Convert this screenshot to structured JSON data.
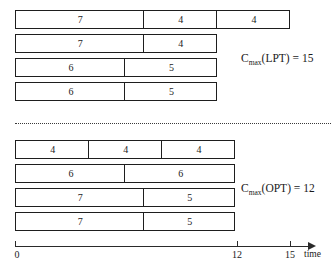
{
  "figure": {
    "axis": {
      "label": "time",
      "origin_value": 0,
      "ticks": [
        {
          "value": 0,
          "label": "0",
          "x": 15
        },
        {
          "value": 12,
          "label": "12",
          "x": 237
        },
        {
          "value": 15,
          "label": "15",
          "x": 290
        }
      ],
      "pixels_per_unit": 18.33,
      "x_start": 15
    },
    "schedules": [
      {
        "name": "LPT",
        "annotation": "C",
        "annotation_sub": "max",
        "annotation_rest": "(LPT) = 15",
        "makespan": 15,
        "annotation_x": 241,
        "annotation_y": 53,
        "machines": [
          {
            "machine": 1,
            "y": 10,
            "jobs": [
              7,
              4,
              4
            ]
          },
          {
            "machine": 2,
            "y": 34,
            "jobs": [
              7,
              4
            ]
          },
          {
            "machine": 3,
            "y": 58,
            "jobs": [
              6,
              5
            ]
          },
          {
            "machine": 4,
            "y": 82,
            "jobs": [
              6,
              5
            ]
          }
        ]
      },
      {
        "name": "OPT",
        "annotation": "C",
        "annotation_sub": "max",
        "annotation_rest": "(OPT) = 12",
        "makespan": 12,
        "annotation_x": 241,
        "annotation_y": 183,
        "machines": [
          {
            "machine": 1,
            "y": 140,
            "jobs": [
              4,
              4,
              4
            ]
          },
          {
            "machine": 2,
            "y": 164,
            "jobs": [
              6,
              6
            ]
          },
          {
            "machine": 3,
            "y": 188,
            "jobs": [
              7,
              5
            ]
          },
          {
            "machine": 4,
            "y": 212,
            "jobs": [
              7,
              5
            ]
          }
        ]
      }
    ],
    "chart_data": {
      "type": "bar",
      "title": "LPT versus optimal schedule on four machines",
      "xlabel": "time",
      "ylabel": "",
      "xlim": [
        0,
        16
      ],
      "grid": false,
      "series": [
        {
          "name": "LPT machine 1",
          "values": [
            7,
            4,
            4
          ],
          "total": 15
        },
        {
          "name": "LPT machine 2",
          "values": [
            7,
            4
          ],
          "total": 11
        },
        {
          "name": "LPT machine 3",
          "values": [
            6,
            5
          ],
          "total": 11
        },
        {
          "name": "LPT machine 4",
          "values": [
            6,
            5
          ],
          "total": 11
        },
        {
          "name": "OPT machine 1",
          "values": [
            4,
            4,
            4
          ],
          "total": 12
        },
        {
          "name": "OPT machine 2",
          "values": [
            6,
            6
          ],
          "total": 12
        },
        {
          "name": "OPT machine 3",
          "values": [
            7,
            5
          ],
          "total": 12
        },
        {
          "name": "OPT machine 4",
          "values": [
            7,
            5
          ],
          "total": 12
        }
      ],
      "annotations": [
        "C_max(LPT) = 15",
        "C_max(OPT) = 12"
      ]
    }
  }
}
